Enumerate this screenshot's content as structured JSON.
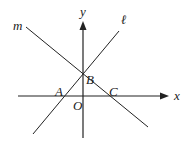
{
  "diagram": {
    "type": "coordinate-geometry",
    "stroke_color": "#222222",
    "background": "#ffffff",
    "axes": {
      "x_label": "x",
      "y_label": "y",
      "origin_label": "O"
    },
    "lines": [
      {
        "name": "m",
        "label": "m",
        "passes_through": [
          "B",
          "C"
        ],
        "slope_sign": "negative"
      },
      {
        "name": "l",
        "label": "ℓ",
        "passes_through": [
          "A",
          "B"
        ],
        "slope_sign": "positive"
      }
    ],
    "points": [
      {
        "name": "A",
        "label": "A",
        "location": "x-axis intersection of line ℓ"
      },
      {
        "name": "B",
        "label": "B",
        "location": "y-axis intersection of lines m and ℓ"
      },
      {
        "name": "C",
        "label": "C",
        "location": "x-axis intersection of line m"
      },
      {
        "name": "O",
        "label": "O",
        "location": "origin"
      }
    ]
  }
}
